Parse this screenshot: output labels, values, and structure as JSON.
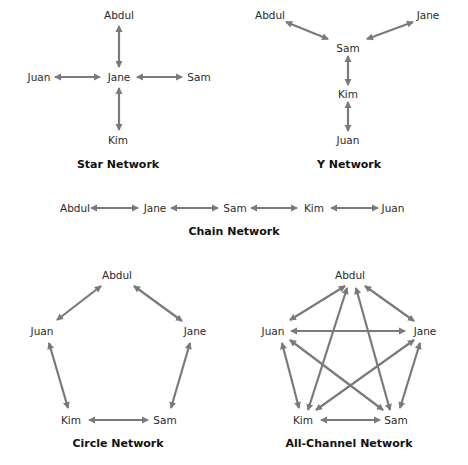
{
  "colors": {
    "edge": "#7a7a7a",
    "text": "#2a2a2a",
    "title": "#111111",
    "background": "#ffffff"
  },
  "diagrams": {
    "star": {
      "title": "Star Network",
      "nodes": {
        "abdul": "Abdul",
        "juan": "Juan",
        "jane": "Jane",
        "sam": "Sam",
        "kim": "Kim"
      },
      "edges": [
        [
          "Jane",
          "Abdul"
        ],
        [
          "Jane",
          "Juan"
        ],
        [
          "Jane",
          "Sam"
        ],
        [
          "Jane",
          "Kim"
        ]
      ]
    },
    "y": {
      "title": "Y Network",
      "nodes": {
        "abdul": "Abdul",
        "jane": "Jane",
        "sam": "Sam",
        "kim": "Kim",
        "juan": "Juan"
      },
      "edges": [
        [
          "Sam",
          "Abdul"
        ],
        [
          "Sam",
          "Jane"
        ],
        [
          "Sam",
          "Kim"
        ],
        [
          "Kim",
          "Juan"
        ]
      ]
    },
    "chain": {
      "title": "Chain Network",
      "nodes": {
        "abdul": "Abdul",
        "jane": "Jane",
        "sam": "Sam",
        "kim": "Kim",
        "juan": "Juan"
      },
      "edges": [
        [
          "Abdul",
          "Jane"
        ],
        [
          "Jane",
          "Sam"
        ],
        [
          "Sam",
          "Kim"
        ],
        [
          "Kim",
          "Juan"
        ]
      ]
    },
    "circle": {
      "title": "Circle Network",
      "nodes": {
        "abdul": "Abdul",
        "juan": "Juan",
        "jane": "Jane",
        "kim": "Kim",
        "sam": "Sam"
      },
      "edges": [
        [
          "Abdul",
          "Juan"
        ],
        [
          "Abdul",
          "Jane"
        ],
        [
          "Juan",
          "Kim"
        ],
        [
          "Jane",
          "Sam"
        ],
        [
          "Kim",
          "Sam"
        ]
      ]
    },
    "all_channel": {
      "title": "All-Channel Network",
      "nodes": {
        "abdul": "Abdul",
        "juan": "Juan",
        "jane": "Jane",
        "kim": "Kim",
        "sam": "Sam"
      },
      "edges": [
        [
          "Abdul",
          "Juan"
        ],
        [
          "Abdul",
          "Jane"
        ],
        [
          "Abdul",
          "Kim"
        ],
        [
          "Abdul",
          "Sam"
        ],
        [
          "Juan",
          "Jane"
        ],
        [
          "Juan",
          "Kim"
        ],
        [
          "Juan",
          "Sam"
        ],
        [
          "Jane",
          "Kim"
        ],
        [
          "Jane",
          "Sam"
        ],
        [
          "Kim",
          "Sam"
        ]
      ]
    }
  }
}
